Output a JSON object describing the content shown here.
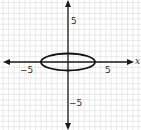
{
  "chart_data": {
    "type": "line",
    "title": "",
    "xlabel": "x",
    "ylabel": "",
    "xlim": [
      -12.5,
      13.5
    ],
    "ylim": [
      -12,
      12
    ],
    "grid": true,
    "tick_labels": {
      "x": [
        "-5",
        "5"
      ],
      "y": [
        "5",
        "-5"
      ]
    },
    "series": [
      {
        "name": "ellipse",
        "shape": "ellipse",
        "center": [
          0,
          0
        ],
        "semi_axis_x": 5,
        "semi_axis_y": 1.6
      }
    ]
  },
  "labels": {
    "x_axis": "x",
    "x_neg": "−5",
    "x_pos": "5",
    "y_pos": "5",
    "y_neg": "−5"
  },
  "colors": {
    "grid": "#e3e3e3",
    "axis": "#1a1a1a",
    "curve": "#111111"
  }
}
